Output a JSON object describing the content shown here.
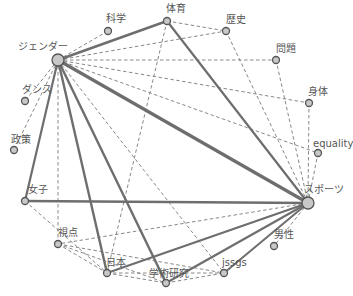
{
  "diagram": {
    "type": "network",
    "nodes": [
      {
        "id": "gender",
        "label": "ジェンダー",
        "x": 58,
        "y": 60,
        "r": 6,
        "lx": 18,
        "ly": 50
      },
      {
        "id": "kagaku",
        "label": "科学",
        "x": 108,
        "y": 31,
        "r": 3.5,
        "lx": 106,
        "ly": 22
      },
      {
        "id": "taiiku",
        "label": "体育",
        "x": 167,
        "y": 21,
        "r": 3.5,
        "lx": 166,
        "ly": 12
      },
      {
        "id": "rekishi",
        "label": "歴史",
        "x": 226,
        "y": 31,
        "r": 3.5,
        "lx": 226,
        "ly": 23
      },
      {
        "id": "mondai",
        "label": "問題",
        "x": 276,
        "y": 60,
        "r": 3.5,
        "lx": 276,
        "ly": 52
      },
      {
        "id": "shintai",
        "label": "身体",
        "x": 309,
        "y": 103,
        "r": 3.5,
        "lx": 308,
        "ly": 95
      },
      {
        "id": "equality",
        "label": "equality",
        "x": 318,
        "y": 153,
        "r": 3.5,
        "lx": 313,
        "ly": 147
      },
      {
        "id": "sports",
        "label": "スポーツ",
        "x": 308,
        "y": 203,
        "r": 6,
        "lx": 304,
        "ly": 193
      },
      {
        "id": "dansei",
        "label": "男性",
        "x": 274,
        "y": 246,
        "r": 3.5,
        "lx": 274,
        "ly": 238
      },
      {
        "id": "jssgs",
        "label": "jssgs",
        "x": 224,
        "y": 273,
        "r": 3.5,
        "lx": 222,
        "ly": 266
      },
      {
        "id": "gakujutsu",
        "label": "学術研究",
        "x": 166,
        "y": 283,
        "r": 3.5,
        "lx": 149,
        "ly": 277
      },
      {
        "id": "nihon",
        "label": "日本",
        "x": 107,
        "y": 273,
        "r": 3.5,
        "lx": 106,
        "ly": 266
      },
      {
        "id": "shiten",
        "label": "視点",
        "x": 58,
        "y": 244,
        "r": 3.5,
        "lx": 58,
        "ly": 236
      },
      {
        "id": "joshi",
        "label": "女子",
        "x": 25,
        "y": 201,
        "r": 3.5,
        "lx": 28,
        "ly": 193
      },
      {
        "id": "seisaku",
        "label": "政策",
        "x": 14,
        "y": 150,
        "r": 3.5,
        "lx": 11,
        "ly": 143
      },
      {
        "id": "dance",
        "label": "ダンス",
        "x": 25,
        "y": 101,
        "r": 3.5,
        "lx": 22,
        "ly": 93
      }
    ],
    "edges": [
      {
        "from": "gender",
        "to": "sports",
        "style": "solid",
        "width": 3.2
      },
      {
        "from": "gender",
        "to": "taiiku",
        "style": "solid",
        "width": 2.4
      },
      {
        "from": "gender",
        "to": "joshi",
        "style": "solid",
        "width": 2.2
      },
      {
        "from": "gender",
        "to": "nihon",
        "style": "solid",
        "width": 2.4
      },
      {
        "from": "gender",
        "to": "gakujutsu",
        "style": "solid",
        "width": 2.4
      },
      {
        "from": "taiiku",
        "to": "sports",
        "style": "solid",
        "width": 2.2
      },
      {
        "from": "joshi",
        "to": "sports",
        "style": "solid",
        "width": 2.4
      },
      {
        "from": "nihon",
        "to": "sports",
        "style": "solid",
        "width": 2.2
      },
      {
        "from": "gakujutsu",
        "to": "sports",
        "style": "solid",
        "width": 2.2
      },
      {
        "from": "jssgs",
        "to": "sports",
        "style": "solid",
        "width": 2.0
      },
      {
        "from": "gender",
        "to": "kagaku",
        "style": "dashed"
      },
      {
        "from": "gender",
        "to": "rekishi",
        "style": "dashed"
      },
      {
        "from": "gender",
        "to": "mondai",
        "style": "dashed"
      },
      {
        "from": "gender",
        "to": "shintai",
        "style": "dashed"
      },
      {
        "from": "gender",
        "to": "equality",
        "style": "dashed"
      },
      {
        "from": "gender",
        "to": "dance",
        "style": "dashed"
      },
      {
        "from": "gender",
        "to": "seisaku",
        "style": "dashed"
      },
      {
        "from": "gender",
        "to": "shiten",
        "style": "dashed"
      },
      {
        "from": "gender",
        "to": "jssgs",
        "style": "dashed"
      },
      {
        "from": "taiiku",
        "to": "rekishi",
        "style": "dashed"
      },
      {
        "from": "taiiku",
        "to": "nihon",
        "style": "dashed"
      },
      {
        "from": "rekishi",
        "to": "sports",
        "style": "dashed"
      },
      {
        "from": "mondai",
        "to": "sports",
        "style": "dashed"
      },
      {
        "from": "shintai",
        "to": "sports",
        "style": "dashed"
      },
      {
        "from": "equality",
        "to": "sports",
        "style": "dashed"
      },
      {
        "from": "sports",
        "to": "shiten",
        "style": "dashed"
      },
      {
        "from": "sports",
        "to": "dansei",
        "style": "dashed"
      },
      {
        "from": "joshi",
        "to": "nihon",
        "style": "dashed"
      },
      {
        "from": "shiten",
        "to": "nihon",
        "style": "dashed"
      },
      {
        "from": "shiten",
        "to": "gakujutsu",
        "style": "dashed"
      },
      {
        "from": "shiten",
        "to": "jssgs",
        "style": "dashed"
      },
      {
        "from": "nihon",
        "to": "gakujutsu",
        "style": "dashed"
      },
      {
        "from": "nihon",
        "to": "jssgs",
        "style": "dashed"
      },
      {
        "from": "gakujutsu",
        "to": "jssgs",
        "style": "dashed"
      }
    ]
  }
}
